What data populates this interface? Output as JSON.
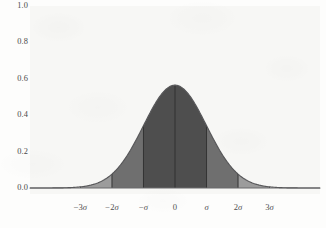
{
  "chart_data": {
    "type": "area",
    "title": "",
    "subtitle": "",
    "xlabel": "",
    "ylabel": "",
    "distribution": "normal",
    "mean": 0,
    "sigma": 1,
    "peak_value": 0.565,
    "grid": false,
    "legend": false,
    "legend_position": "none",
    "xlim": [
      -4.6,
      4.6
    ],
    "ylim": [
      0.0,
      1.0
    ],
    "yticks": [
      "1.0",
      "0.8",
      "0.6",
      "0.4",
      "0.2",
      "0.0"
    ],
    "ytick_values": [
      1.0,
      0.8,
      0.6,
      0.4,
      0.2,
      0.0
    ],
    "xticks": [
      "−3σ",
      "−2σ",
      "−σ",
      "0",
      "σ",
      "2σ",
      "3σ"
    ],
    "xtick_values": [
      -3,
      -2,
      -1,
      0,
      1,
      2,
      3
    ],
    "curve_points": [
      {
        "x": -4.6,
        "y": 0.0
      },
      {
        "x": -4.0,
        "y": 0.0
      },
      {
        "x": -3.5,
        "y": 0.005
      },
      {
        "x": -3.0,
        "y": 0.025
      },
      {
        "x": -2.5,
        "y": 0.07
      },
      {
        "x": -2.0,
        "y": 0.153
      },
      {
        "x": -1.5,
        "y": 0.277
      },
      {
        "x": -1.0,
        "y": 0.412
      },
      {
        "x": -0.5,
        "y": 0.521
      },
      {
        "x": 0.0,
        "y": 0.565
      },
      {
        "x": 0.5,
        "y": 0.521
      },
      {
        "x": 1.0,
        "y": 0.412
      },
      {
        "x": 1.5,
        "y": 0.277
      },
      {
        "x": 2.0,
        "y": 0.153
      },
      {
        "x": 2.5,
        "y": 0.07
      },
      {
        "x": 3.0,
        "y": 0.025
      },
      {
        "x": 3.5,
        "y": 0.005
      },
      {
        "x": 4.0,
        "y": 0.0
      },
      {
        "x": 4.6,
        "y": 0.0
      }
    ],
    "bands": [
      {
        "name": "outer-left",
        "from": -3,
        "to": -2,
        "shade": "light"
      },
      {
        "name": "mid-left",
        "from": -2,
        "to": -1,
        "shade": "medium"
      },
      {
        "name": "core",
        "from": -1,
        "to": 1,
        "shade": "dark"
      },
      {
        "name": "mid-right",
        "from": 1,
        "to": 2,
        "shade": "medium"
      },
      {
        "name": "outer-right",
        "from": 2,
        "to": 3,
        "shade": "light"
      }
    ],
    "divider_positions": [
      -3,
      -2,
      -1,
      0,
      1,
      2,
      3
    ]
  },
  "colors": {
    "figure_background": "#fdfdfc",
    "panel_background": "#f7f7f5",
    "band_light": "#9c9c9c",
    "band_medium": "#6f6f6f",
    "band_dark": "#4e4e4e",
    "divider_line": "#2e2e2e",
    "curve_stroke": "#58585a",
    "baseline": "#6a6a6c",
    "tick_text": "#4a4a4a"
  }
}
